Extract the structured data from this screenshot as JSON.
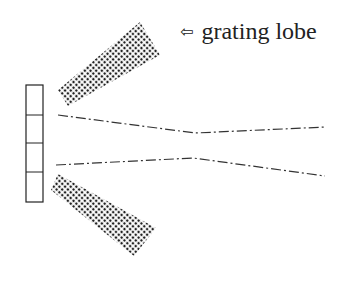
{
  "diagram": {
    "label": {
      "arrow_icon": "hollow-left-arrow-icon",
      "arrow_glyph": "⇦",
      "text": "grating lobe"
    },
    "array": {
      "elements": 4
    },
    "colors": {
      "ink": "#222222",
      "background": "#ffffff"
    }
  }
}
